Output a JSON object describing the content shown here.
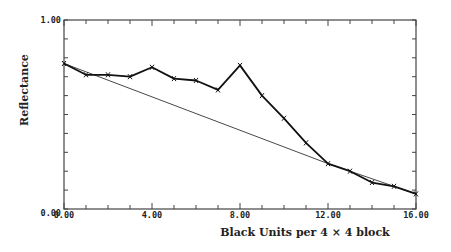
{
  "chart_data": {
    "type": "line",
    "title": "",
    "xlabel": "Black Units per 4 × 4 block",
    "ylabel": "Reflectance",
    "xlim": [
      0,
      16
    ],
    "ylim": [
      0,
      1
    ],
    "grid": false,
    "legend": null,
    "x_tick_labels": [
      "0.00",
      "4.00",
      "8.00",
      "12.00",
      "16.00"
    ],
    "x_tick_values": [
      0,
      4,
      8,
      12,
      16
    ],
    "y_tick_labels": [
      "0.00",
      "1.00"
    ],
    "y_tick_values": [
      0,
      1
    ],
    "minor_x_tick_step": 1,
    "minor_y_tick_step": 0.1,
    "series": [
      {
        "name": "Measured reflectance",
        "style": "thick line with x markers",
        "x": [
          0,
          1,
          2,
          3,
          4,
          5,
          6,
          7,
          8,
          9,
          10,
          11,
          12,
          13,
          14,
          15,
          16
        ],
        "values": [
          0.77,
          0.71,
          0.71,
          0.7,
          0.75,
          0.69,
          0.68,
          0.63,
          0.76,
          0.6,
          0.48,
          0.35,
          0.24,
          0.2,
          0.14,
          0.12,
          0.08
        ]
      },
      {
        "name": "Linear reference",
        "style": "thin line",
        "x": [
          0,
          12,
          16
        ],
        "values": [
          0.77,
          0.24,
          0.08
        ]
      }
    ]
  }
}
